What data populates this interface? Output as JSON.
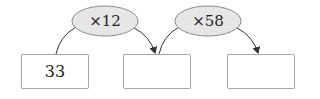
{
  "diagram": {
    "operators": [
      {
        "label": "×12"
      },
      {
        "label": "×58"
      }
    ],
    "boxes": [
      {
        "value": "33"
      },
      {
        "value": ""
      },
      {
        "value": ""
      }
    ],
    "colors": {
      "ellipse_fill": "#e6e6e6",
      "ellipse_stroke": "#8a8a8a",
      "line": "#333333",
      "box_border": "#a8a8a8"
    }
  }
}
